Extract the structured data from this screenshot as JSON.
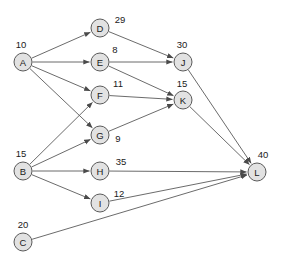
{
  "diagram": {
    "type": "directed-graph",
    "width": 286,
    "height": 265,
    "node_radius": 9,
    "colors": {
      "node_fill": "#e2e2e2",
      "node_stroke": "#5a5a5a",
      "edge": "#5a5a5a",
      "text": "#1a1a1a",
      "background": "#ffffff"
    },
    "nodes": [
      {
        "id": "A",
        "label": "A",
        "value": "10",
        "x": 23,
        "y": 62,
        "value_x": 21,
        "value_y": 48
      },
      {
        "id": "B",
        "label": "B",
        "value": "15",
        "x": 23,
        "y": 171,
        "value_x": 21,
        "value_y": 157
      },
      {
        "id": "C",
        "label": "C",
        "value": "20",
        "x": 23,
        "y": 242,
        "value_x": 23,
        "value_y": 228
      },
      {
        "id": "D",
        "label": "D",
        "value": "29",
        "x": 100,
        "y": 28,
        "value_x": 120,
        "value_y": 23
      },
      {
        "id": "E",
        "label": "E",
        "value": "8",
        "x": 100,
        "y": 62,
        "value_x": 115,
        "value_y": 53
      },
      {
        "id": "F",
        "label": "F",
        "value": "11",
        "x": 100,
        "y": 95,
        "value_x": 118,
        "value_y": 87
      },
      {
        "id": "G",
        "label": "G",
        "value": "9",
        "x": 100,
        "y": 135,
        "value_x": 118,
        "value_y": 142
      },
      {
        "id": "H",
        "label": "H",
        "value": "35",
        "x": 100,
        "y": 171,
        "value_x": 121,
        "value_y": 165
      },
      {
        "id": "I",
        "label": "I",
        "value": "12",
        "x": 100,
        "y": 203,
        "value_x": 119,
        "value_y": 197
      },
      {
        "id": "J",
        "label": "J",
        "value": "30",
        "x": 183,
        "y": 62,
        "value_x": 182,
        "value_y": 48
      },
      {
        "id": "K",
        "label": "K",
        "value": "15",
        "x": 183,
        "y": 100,
        "value_x": 182,
        "value_y": 87
      },
      {
        "id": "L",
        "label": "L",
        "value": "40",
        "x": 257,
        "y": 172,
        "value_x": 263,
        "value_y": 158
      }
    ],
    "edges": [
      {
        "from": "A",
        "to": "D"
      },
      {
        "from": "A",
        "to": "E"
      },
      {
        "from": "A",
        "to": "F"
      },
      {
        "from": "A",
        "to": "G"
      },
      {
        "from": "B",
        "to": "F"
      },
      {
        "from": "B",
        "to": "G"
      },
      {
        "from": "B",
        "to": "H"
      },
      {
        "from": "B",
        "to": "I"
      },
      {
        "from": "D",
        "to": "J"
      },
      {
        "from": "E",
        "to": "J"
      },
      {
        "from": "E",
        "to": "K"
      },
      {
        "from": "F",
        "to": "K"
      },
      {
        "from": "G",
        "to": "K"
      },
      {
        "from": "J",
        "to": "L"
      },
      {
        "from": "K",
        "to": "L"
      },
      {
        "from": "H",
        "to": "L"
      },
      {
        "from": "I",
        "to": "L"
      },
      {
        "from": "C",
        "to": "L"
      }
    ]
  }
}
